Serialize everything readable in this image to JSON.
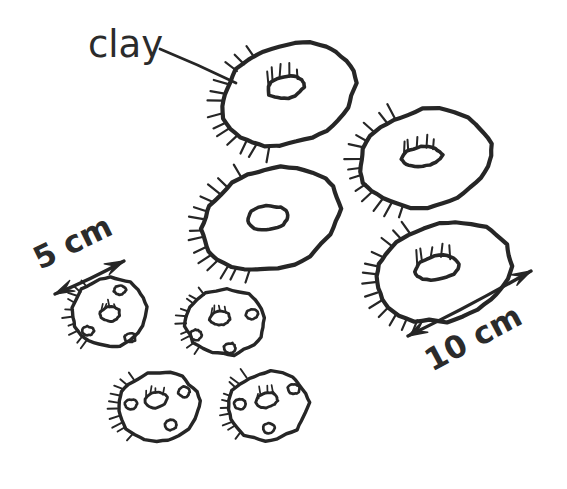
{
  "figure": {
    "background_color": "#ffffff",
    "ink_color": "#262626",
    "text_color": "#2b2b2b",
    "width": 567,
    "height": 489
  },
  "labels": {
    "material": "clay",
    "scale_small": "5 cm",
    "scale_large": "10 cm"
  },
  "annotations": {
    "leader_line": {
      "from_x": 160,
      "from_y": 49,
      "to_x": 236,
      "to_y": 83
    },
    "scale_small_arrow": {
      "x1": 55,
      "y1": 294,
      "x2": 124,
      "y2": 261,
      "label_x": 40,
      "label_y": 270,
      "label_rotation": -26
    },
    "scale_large_arrow": {
      "x1": 408,
      "y1": 336,
      "x2": 531,
      "y2": 271,
      "label_x": 432,
      "label_y": 372,
      "label_rotation": -28
    }
  },
  "shapes": {
    "large_discs": [
      {
        "name": "disc-top-left",
        "cx": 288,
        "cy": 95,
        "rx": 69,
        "ry": 49,
        "rotation": -20,
        "hole_cx": 286,
        "hole_cy": 87,
        "hole_rx": 19,
        "hole_ry": 11,
        "hole_rotation": -12,
        "hole_hatch": true,
        "rim_hatch_start": 120,
        "rim_hatch_end": 255,
        "rim_hatch_count": 13
      },
      {
        "name": "disc-top-right",
        "cx": 425,
        "cy": 158,
        "rx": 66,
        "ry": 48,
        "rotation": -12,
        "hole_cx": 422,
        "hole_cy": 157,
        "hole_rx": 20,
        "hole_ry": 10,
        "hole_rotation": -6,
        "hole_hatch": true,
        "rim_hatch_start": 118,
        "rim_hatch_end": 252,
        "rim_hatch_count": 13
      },
      {
        "name": "disc-middle",
        "cx": 271,
        "cy": 219,
        "rx": 71,
        "ry": 49,
        "rotation": -18,
        "hole_cx": 268,
        "hole_cy": 218,
        "hole_rx": 21,
        "hole_ry": 12,
        "hole_rotation": -8,
        "hole_hatch": false,
        "rim_hatch_start": 122,
        "rim_hatch_end": 256,
        "rim_hatch_count": 14
      },
      {
        "name": "disc-bottom-right",
        "cx": 443,
        "cy": 272,
        "rx": 69,
        "ry": 48,
        "rotation": -14,
        "hole_cx": 437,
        "hole_cy": 268,
        "hole_rx": 22,
        "hole_ry": 12,
        "hole_rotation": -10,
        "hole_hatch": true,
        "rim_hatch_start": 122,
        "rim_hatch_end": 250,
        "rim_hatch_count": 13
      }
    ],
    "small_discs": [
      {
        "name": "small-disc-left",
        "cx": 110,
        "cy": 312,
        "rx": 37,
        "ry": 34,
        "rotation": -8,
        "hole_cx": 110,
        "hole_cy": 314,
        "hole_rx": 10,
        "hole_ry": 7,
        "hole_rotation": -6,
        "rim_hatch_start": 135,
        "rim_hatch_end": 238,
        "rim_hatch_count": 10,
        "dots": [
          {
            "cx": 120,
            "cy": 290,
            "rx": 6,
            "ry": 4.5
          },
          {
            "cx": 88,
            "cy": 331,
            "rx": 5.5,
            "ry": 4.5
          },
          {
            "cx": 130,
            "cy": 338,
            "rx": 5.5,
            "ry": 4.5
          }
        ]
      },
      {
        "name": "small-disc-middle",
        "cx": 225,
        "cy": 322,
        "rx": 39,
        "ry": 33,
        "rotation": -6,
        "hole_cx": 220,
        "hole_cy": 318,
        "hole_rx": 10,
        "hole_ry": 7,
        "hole_rotation": -10,
        "rim_hatch_start": 138,
        "rim_hatch_end": 242,
        "rim_hatch_count": 10,
        "dots": [
          {
            "cx": 252,
            "cy": 314,
            "rx": 6,
            "ry": 5
          },
          {
            "cx": 196,
            "cy": 335,
            "rx": 6,
            "ry": 5
          },
          {
            "cx": 230,
            "cy": 348,
            "rx": 6,
            "ry": 5
          }
        ]
      },
      {
        "name": "small-disc-bottom-left",
        "cx": 158,
        "cy": 406,
        "rx": 41,
        "ry": 34,
        "rotation": -7,
        "hole_cx": 156,
        "hole_cy": 400,
        "hole_rx": 11,
        "hole_ry": 7.5,
        "hole_rotation": -14,
        "rim_hatch_start": 136,
        "rim_hatch_end": 240,
        "rim_hatch_count": 10,
        "dots": [
          {
            "cx": 184,
            "cy": 392,
            "rx": 6,
            "ry": 5
          },
          {
            "cx": 131,
            "cy": 404,
            "rx": 6,
            "ry": 5
          },
          {
            "cx": 171,
            "cy": 425,
            "rx": 6,
            "ry": 5
          }
        ]
      },
      {
        "name": "small-disc-bottom-right",
        "cx": 268,
        "cy": 406,
        "rx": 40,
        "ry": 34,
        "rotation": -5,
        "hole_cx": 267,
        "hole_cy": 400,
        "hole_rx": 11,
        "hole_ry": 7.5,
        "hole_rotation": -12,
        "rim_hatch_start": 137,
        "rim_hatch_end": 240,
        "rim_hatch_count": 10,
        "dots": [
          {
            "cx": 294,
            "cy": 389,
            "rx": 6,
            "ry": 5
          },
          {
            "cx": 240,
            "cy": 404,
            "rx": 6,
            "ry": 5
          },
          {
            "cx": 269,
            "cy": 428,
            "rx": 6,
            "ry": 5
          }
        ]
      }
    ]
  }
}
